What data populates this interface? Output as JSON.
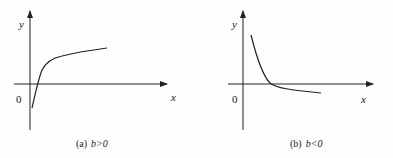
{
  "figures": [
    {
      "id": "a",
      "caption_prefix": "(a)",
      "caption_condition": "b>0",
      "axis_x_label": "x",
      "axis_y_label": "y",
      "origin_label": "0",
      "curve_description": "increasing concave curve crossing x-axis, steep near y-axis"
    },
    {
      "id": "b",
      "caption_prefix": "(b)",
      "caption_condition": "b<0",
      "axis_x_label": "x",
      "axis_y_label": "y",
      "origin_label": "0",
      "curve_description": "decreasing convex curve crossing x-axis, steep near y-axis"
    }
  ],
  "colors": {
    "ink": "#222222",
    "background": "#fdfdfd"
  }
}
